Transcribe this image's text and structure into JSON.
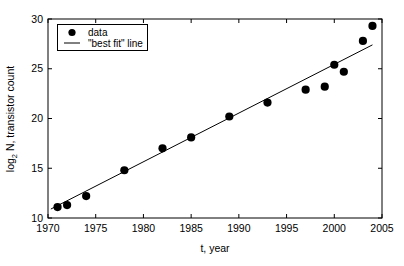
{
  "chart_data": {
    "type": "scatter",
    "title": "",
    "xlabel": "t, year",
    "ylabel": "log2 N, transistor count",
    "ylabel_base": "log",
    "ylabel_sub": "2",
    "ylabel_rest": " N, transistor count",
    "xlim": [
      1970,
      2005
    ],
    "ylim": [
      10,
      30
    ],
    "xticks": [
      1970,
      1975,
      1980,
      1985,
      1990,
      1995,
      2000,
      2005
    ],
    "xticklabels": [
      "1970",
      "1975",
      "1980",
      "1985",
      "1990",
      "1995",
      "2000",
      "2005"
    ],
    "yticks": [
      10,
      15,
      20,
      25,
      30
    ],
    "yticklabels": [
      "10",
      "15",
      "20",
      "25",
      "30"
    ],
    "grid": false,
    "legend_position": "upper left",
    "legend": [
      {
        "label": "data",
        "marker": "filled-circle"
      },
      {
        "label": "\"best fit\" line",
        "marker": "line"
      }
    ],
    "series": [
      {
        "name": "data",
        "type": "scatter",
        "marker": "filled-circle",
        "color": "#000000",
        "x": [
          1971,
          1972,
          1974,
          1978,
          1982,
          1985,
          1989,
          1993,
          1997,
          1999,
          2000,
          2001,
          2003,
          2004
        ],
        "y": [
          11.1,
          11.3,
          12.2,
          14.8,
          17.0,
          18.1,
          20.2,
          21.6,
          22.9,
          23.2,
          25.4,
          24.7,
          27.8,
          29.3
        ]
      },
      {
        "name": "\"best fit\" line",
        "type": "line",
        "color": "#000000",
        "x": [
          1970.3,
          2004.0
        ],
        "y": [
          10.9,
          27.4
        ]
      }
    ]
  }
}
